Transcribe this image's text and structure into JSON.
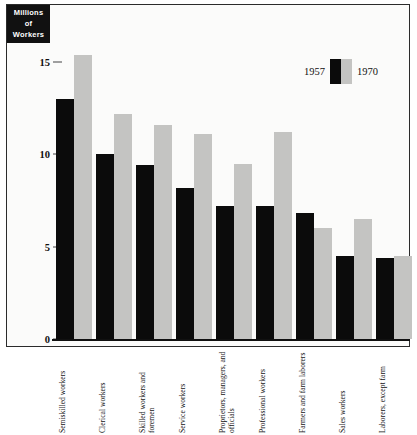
{
  "chart_data": {
    "type": "bar",
    "title": "",
    "subtitle": "",
    "xlabel": "",
    "ylabel": "Millions of Workers",
    "ylabel_lines": [
      "Millions",
      "of",
      "Workers"
    ],
    "ylim": [
      0,
      16.2
    ],
    "yticks": [
      0,
      5,
      10,
      15
    ],
    "ytick_labels": [
      "0",
      "5",
      "10",
      "15"
    ],
    "grid": false,
    "legend_position": "top-right",
    "categories": [
      "Semiskilled workers",
      "Clerical workers",
      "Skilled workers and foremen",
      "Service workers",
      "Proprietors, managers, and officials",
      "Professional workers",
      "Farmers and farm laborers",
      "Sales workers",
      "Laborers, except farm"
    ],
    "series": [
      {
        "name": "1957",
        "color": "#0b0b0b",
        "values": [
          13.0,
          10.0,
          9.4,
          8.2,
          7.2,
          7.2,
          6.8,
          4.5,
          4.4
        ]
      },
      {
        "name": "1970",
        "color": "#c4c4c2",
        "values": [
          15.4,
          12.2,
          11.6,
          11.1,
          9.5,
          11.2,
          6.0,
          6.5,
          4.5
        ]
      }
    ]
  },
  "legend": {
    "entries": [
      {
        "label": "1957",
        "swatch": "dark-swatch"
      },
      {
        "label": "1970",
        "swatch": "light-swatch"
      }
    ]
  },
  "colors": {
    "series_1957": "#0b0b0b",
    "series_1970": "#c4c4c2",
    "frame": "#2b2b2b",
    "background": "#fbfbfa",
    "title_box": "#111111"
  }
}
